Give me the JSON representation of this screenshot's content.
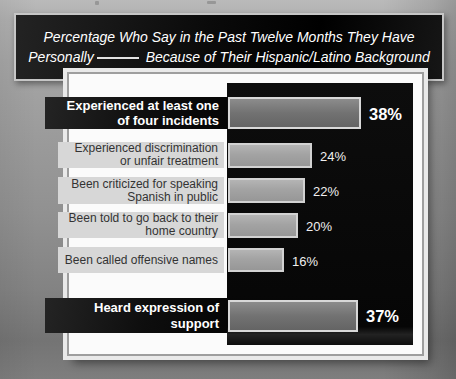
{
  "title": {
    "line1": "Percentage Who Say in the Past Twelve Months They Have",
    "line2_prefix": "Personally",
    "line2_suffix": "Because of Their Hispanic/Latino Background"
  },
  "chart_data": {
    "type": "bar",
    "orientation": "horizontal",
    "unit": "percent",
    "xlim": [
      0,
      50
    ],
    "grid": false,
    "legend": null,
    "categories": [
      "Experienced at least one of four incidents",
      "Experienced discrimination or unfair treatment",
      "Been criticized for speaking Spanish in public",
      "Been told to go back to their home country",
      "Been called offensive names",
      "Heard expression of support"
    ],
    "values": [
      38,
      24,
      22,
      20,
      16,
      37
    ],
    "rows": [
      {
        "label_lines": [
          "Experienced at least one",
          "of four incidents"
        ],
        "value": 38,
        "display": "38%",
        "emphasis": true
      },
      {
        "label_lines": [
          "Experienced discrimination",
          "or unfair treatment"
        ],
        "value": 24,
        "display": "24%",
        "emphasis": false
      },
      {
        "label_lines": [
          "Been criticized for speaking",
          "Spanish in public"
        ],
        "value": 22,
        "display": "22%",
        "emphasis": false
      },
      {
        "label_lines": [
          "Been told to go back to their",
          "home country"
        ],
        "value": 20,
        "display": "20%",
        "emphasis": false
      },
      {
        "label_lines": [
          "Been called offensive names"
        ],
        "value": 16,
        "display": "16%",
        "emphasis": false
      },
      {
        "label_lines": [
          "Heard expression of",
          "support"
        ],
        "value": 37,
        "display": "37%",
        "emphasis": true
      }
    ]
  },
  "colors": {
    "plot_bg": "#0b0b0b",
    "panel_bg": "#fbfbfb",
    "bar_normal": "#a3a3a3",
    "bar_emphasis": "#717171",
    "bar_border": "#d2d2d2",
    "chip_dark_bg": "#121212",
    "chip_light_bg": "#d7d7d7",
    "title_bg": "#0a0a0a",
    "title_text": "#ffffff"
  }
}
